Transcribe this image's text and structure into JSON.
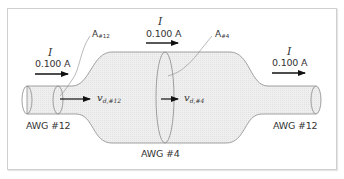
{
  "diagram": {
    "type": "wire cross-section current flow",
    "colors": {
      "wire_fill": "#ececec",
      "wire_outline": "#8a8a8a",
      "arrow": "#111111",
      "text": "#333333",
      "frame": "#cfcfcf"
    },
    "currents": [
      {
        "symbol": "I",
        "value": "0.100 A",
        "position": "left"
      },
      {
        "symbol": "I",
        "value": "0.100 A",
        "position": "middle"
      },
      {
        "symbol": "I",
        "value": "0.100 A",
        "position": "right"
      }
    ],
    "areas": [
      {
        "base": "A",
        "sub": "#12"
      },
      {
        "base": "A",
        "sub": "#4"
      }
    ],
    "drift_velocities": [
      {
        "base": "v",
        "sub": "d,#12"
      },
      {
        "base": "v",
        "sub": "d,#4"
      }
    ],
    "wire_labels": [
      {
        "text": "AWG #12",
        "position": "left"
      },
      {
        "text": "AWG #4",
        "position": "middle"
      },
      {
        "text": "AWG #12",
        "position": "right"
      }
    ]
  }
}
